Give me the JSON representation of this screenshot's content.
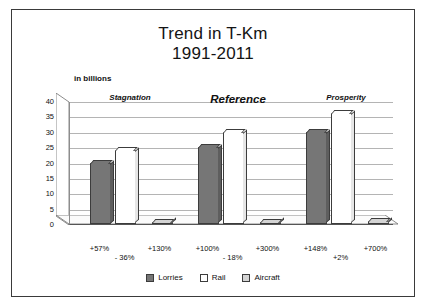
{
  "chart_data": {
    "type": "bar",
    "title": "Trend in T-Km",
    "subtitle": "1991-2011",
    "ylabel": "in billions",
    "xlabel": "",
    "grid": true,
    "legend_position": "bottom",
    "ylim": [
      0,
      40
    ],
    "yticks": [
      "40",
      "35",
      "30",
      "25",
      "20",
      "15",
      "10",
      "5",
      "0"
    ],
    "ytick_values": [
      40,
      35,
      30,
      25,
      20,
      15,
      10,
      5,
      0
    ],
    "categories": [
      "Stagnation",
      "Reference",
      "Prosperity"
    ],
    "series": [
      {
        "name": "Lorries",
        "color": "#767676",
        "values": [
          20,
          25,
          30
        ]
      },
      {
        "name": "Rail",
        "color": "#ffffff",
        "values": [
          24,
          30,
          36
        ]
      },
      {
        "name": "Aircraft",
        "color": "#d4d4d4",
        "values": [
          0.5,
          0.7,
          1.0
        ]
      }
    ],
    "annotations": [
      {
        "group": "Stagnation",
        "lorries": "+57%",
        "rail": "- 36%",
        "aircraft": "+130%"
      },
      {
        "group": "Reference",
        "lorries": "+100%",
        "rail": "- 18%",
        "aircraft": "+300%"
      },
      {
        "group": "Prosperity",
        "lorries": "+148%",
        "rail": "+2%",
        "aircraft": "+700%"
      }
    ]
  },
  "chart": {
    "title_line1": "Trend in T-Km",
    "title_line2": "1991-2011",
    "units_label": "in billions",
    "panels": [
      {
        "label": "Stagnation",
        "emphasis": "small"
      },
      {
        "label": "Reference",
        "emphasis": "big"
      },
      {
        "label": "Prosperity",
        "emphasis": "small"
      }
    ]
  },
  "legend": {
    "items": [
      {
        "label": "Lorries",
        "color": "#767676"
      },
      {
        "label": "Rail",
        "color": "#ffffff"
      },
      {
        "label": "Aircraft",
        "color": "#d4d4d4"
      }
    ]
  },
  "percent_labels": [
    {
      "text": "+57%",
      "group": 0,
      "row": 0,
      "col": 0
    },
    {
      "text": "- 36%",
      "group": 0,
      "row": 1,
      "col": 1
    },
    {
      "text": "+130%",
      "group": 0,
      "row": 0,
      "col": 2
    },
    {
      "text": "+100%",
      "group": 1,
      "row": 0,
      "col": 0
    },
    {
      "text": "- 18%",
      "group": 1,
      "row": 1,
      "col": 1
    },
    {
      "text": "+300%",
      "group": 1,
      "row": 0,
      "col": 2
    },
    {
      "text": "+148%",
      "group": 2,
      "row": 0,
      "col": 0
    },
    {
      "text": "+2%",
      "group": 2,
      "row": 1,
      "col": 1
    },
    {
      "text": "+700%",
      "group": 2,
      "row": 0,
      "col": 2
    }
  ]
}
